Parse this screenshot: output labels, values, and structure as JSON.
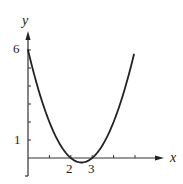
{
  "chart_data": {
    "type": "line",
    "title": "",
    "xlabel": "x",
    "ylabel": "y",
    "function": "y = x^2 - 5x + 6",
    "series": [
      {
        "name": "parabola",
        "x": [
          0,
          0.5,
          1,
          1.5,
          2,
          2.5,
          3,
          3.5,
          4,
          4.5,
          4.95
        ],
        "values": [
          6,
          3.75,
          2,
          0.75,
          0,
          -0.25,
          0,
          0.75,
          2,
          3.75,
          5.75
        ]
      }
    ],
    "xlim": [
      0,
      6.3
    ],
    "ylim": [
      -1,
      7
    ],
    "grid": false,
    "x_ticks": [
      1,
      2,
      3,
      4,
      5
    ],
    "x_tick_labels": [
      {
        "value": 2,
        "label": "2"
      },
      {
        "value": 3,
        "label": "3"
      }
    ],
    "y_ticks": [
      1,
      2,
      3,
      4,
      5,
      6
    ],
    "y_tick_labels": [
      {
        "value": 6,
        "label": "6"
      },
      {
        "value": 1,
        "label": "1"
      }
    ],
    "annotations": [
      "x-intercepts at 2 and 3",
      "y-intercept at 6",
      "vertex at (2.5, -0.25)"
    ]
  },
  "labels": {
    "x_axis": "x",
    "y_axis": "y",
    "y6": "6",
    "y1": "1",
    "x2": "2",
    "x3": "3"
  },
  "colors": {
    "curve": "#222222",
    "axes": "#333333",
    "background": "#ffffff"
  }
}
